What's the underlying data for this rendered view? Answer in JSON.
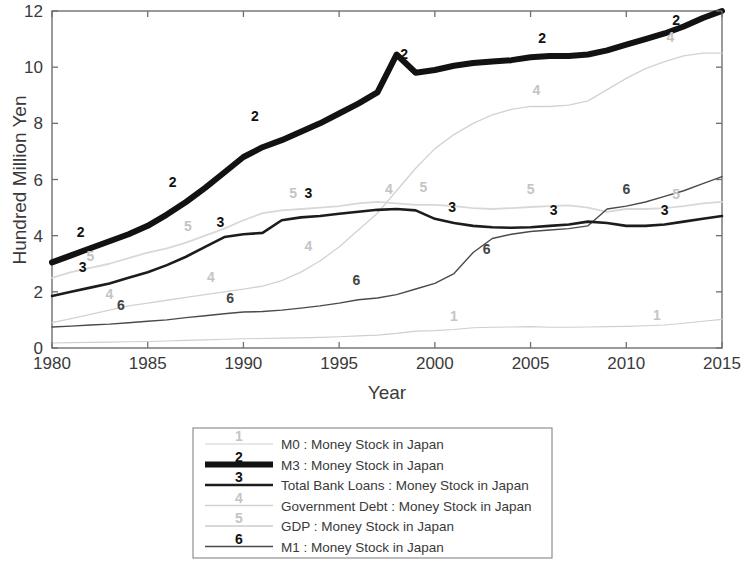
{
  "figure": {
    "background_color": "#ffffff",
    "axis_color": "#6f6f6f"
  },
  "chart_data": {
    "type": "line",
    "title": "",
    "subtitle": "",
    "xlabel": "Year",
    "ylabel": "Hundred Million Yen",
    "xlim": [
      1980,
      2015
    ],
    "ylim": [
      0,
      12
    ],
    "xticks": [
      1980,
      1985,
      1990,
      1995,
      2000,
      2005,
      2010,
      2015
    ],
    "xtick_labels": [
      "1980",
      "1985",
      "1990",
      "1995",
      "2000",
      "2005",
      "2010",
      "2015"
    ],
    "yticks": [
      0,
      2,
      4,
      6,
      8,
      10,
      12
    ],
    "ytick_labels": [
      "0",
      "2",
      "4",
      "6",
      "8",
      "10",
      "12"
    ],
    "grid": false,
    "legend_position": "below-center",
    "x": [
      1980,
      1981,
      1982,
      1983,
      1984,
      1985,
      1986,
      1987,
      1988,
      1989,
      1990,
      1991,
      1992,
      1993,
      1994,
      1995,
      1996,
      1997,
      1998,
      1999,
      2000,
      2001,
      2002,
      2003,
      2004,
      2005,
      2006,
      2007,
      2008,
      2009,
      2010,
      2011,
      2012,
      2013,
      2014,
      2015
    ],
    "series": [
      {
        "id": 1,
        "marker": "1",
        "name": "M0 : Money Stock in Japan",
        "color": "#cfcfcf",
        "width": 1.1,
        "values": [
          0.18,
          0.19,
          0.2,
          0.21,
          0.22,
          0.23,
          0.25,
          0.27,
          0.29,
          0.31,
          0.33,
          0.34,
          0.35,
          0.36,
          0.38,
          0.4,
          0.43,
          0.46,
          0.52,
          0.6,
          0.62,
          0.66,
          0.72,
          0.74,
          0.75,
          0.76,
          0.74,
          0.74,
          0.75,
          0.76,
          0.77,
          0.79,
          0.82,
          0.88,
          0.95,
          1.02
        ]
      },
      {
        "id": 2,
        "marker": "2",
        "name": "M3 : Money Stock in Japan",
        "color": "#121212",
        "width": 6.0,
        "values": [
          3.05,
          3.3,
          3.55,
          3.8,
          4.05,
          4.35,
          4.75,
          5.2,
          5.7,
          6.25,
          6.8,
          7.15,
          7.4,
          7.7,
          8.0,
          8.35,
          8.7,
          9.1,
          10.45,
          9.8,
          9.9,
          10.05,
          10.15,
          10.2,
          10.25,
          10.35,
          10.4,
          10.4,
          10.45,
          10.6,
          10.8,
          11.0,
          11.2,
          11.45,
          11.75,
          12.0
        ]
      },
      {
        "id": 3,
        "marker": "3",
        "name": "Total Bank Loans : Money Stock in Japan",
        "color": "#1c1c1c",
        "width": 2.6,
        "values": [
          1.85,
          2.0,
          2.15,
          2.3,
          2.5,
          2.7,
          2.95,
          3.25,
          3.6,
          3.95,
          4.05,
          4.1,
          4.55,
          4.65,
          4.7,
          4.78,
          4.85,
          4.92,
          4.95,
          4.9,
          4.6,
          4.45,
          4.35,
          4.3,
          4.28,
          4.3,
          4.35,
          4.4,
          4.5,
          4.45,
          4.35,
          4.35,
          4.4,
          4.5,
          4.6,
          4.7
        ]
      },
      {
        "id": 4,
        "marker": "4",
        "name": "Government Debt : Money Stock in Japan",
        "color": "#d2d2d2",
        "width": 1.3,
        "values": [
          0.9,
          1.05,
          1.2,
          1.35,
          1.5,
          1.6,
          1.7,
          1.8,
          1.9,
          2.0,
          2.1,
          2.2,
          2.4,
          2.7,
          3.1,
          3.6,
          4.2,
          4.8,
          5.6,
          6.4,
          7.1,
          7.6,
          8.0,
          8.3,
          8.5,
          8.6,
          8.6,
          8.65,
          8.8,
          9.2,
          9.6,
          9.95,
          10.2,
          10.4,
          10.5,
          10.5
        ]
      },
      {
        "id": 5,
        "marker": "5",
        "name": "GDP : Money Stock in Japan",
        "color": "#d8d8d8",
        "width": 1.8,
        "values": [
          2.5,
          2.7,
          2.85,
          3.0,
          3.2,
          3.4,
          3.55,
          3.75,
          4.0,
          4.25,
          4.55,
          4.8,
          4.9,
          4.95,
          5.0,
          5.05,
          5.15,
          5.2,
          5.15,
          5.1,
          5.1,
          5.05,
          4.98,
          4.95,
          4.98,
          5.02,
          5.05,
          5.08,
          5.0,
          4.85,
          4.95,
          4.95,
          4.98,
          5.05,
          5.15,
          5.2
        ]
      },
      {
        "id": 6,
        "marker": "6",
        "name": "M1 : Money Stock in Japan",
        "color": "#4a4a4a",
        "width": 1.4,
        "values": [
          0.75,
          0.78,
          0.82,
          0.85,
          0.9,
          0.95,
          1.0,
          1.08,
          1.15,
          1.22,
          1.28,
          1.3,
          1.35,
          1.42,
          1.5,
          1.6,
          1.72,
          1.78,
          1.9,
          2.1,
          2.3,
          2.65,
          3.4,
          3.9,
          4.05,
          4.15,
          4.2,
          4.25,
          4.35,
          4.95,
          5.05,
          5.2,
          5.4,
          5.6,
          5.85,
          6.1
        ]
      }
    ],
    "inline_labels": [
      {
        "series": 2,
        "text": "2",
        "x": 1981.5,
        "y": 3.95
      },
      {
        "series": 2,
        "text": "2",
        "x": 1986.3,
        "y": 5.75
      },
      {
        "series": 2,
        "text": "2",
        "x": 1990.6,
        "y": 8.1
      },
      {
        "series": 2,
        "text": "2",
        "x": 1998.4,
        "y": 10.3
      },
      {
        "series": 2,
        "text": "2",
        "x": 2005.6,
        "y": 10.85
      },
      {
        "series": 2,
        "text": "2",
        "x": 2012.6,
        "y": 11.5
      },
      {
        "series": 3,
        "text": "3",
        "x": 1981.6,
        "y": 2.7
      },
      {
        "series": 3,
        "text": "3",
        "x": 1988.8,
        "y": 4.3
      },
      {
        "series": 3,
        "text": "3",
        "x": 1993.4,
        "y": 5.35
      },
      {
        "series": 3,
        "text": "3",
        "x": 2000.9,
        "y": 4.85
      },
      {
        "series": 3,
        "text": "3",
        "x": 2006.2,
        "y": 4.75
      },
      {
        "series": 3,
        "text": "3",
        "x": 2012.0,
        "y": 4.75
      },
      {
        "series": 6,
        "text": "6",
        "x": 1983.6,
        "y": 1.35
      },
      {
        "series": 6,
        "text": "6",
        "x": 1989.3,
        "y": 1.6
      },
      {
        "series": 6,
        "text": "6",
        "x": 1995.9,
        "y": 2.25
      },
      {
        "series": 6,
        "text": "6",
        "x": 2002.7,
        "y": 3.35
      },
      {
        "series": 6,
        "text": "6",
        "x": 2010.0,
        "y": 5.5
      },
      {
        "series": 4,
        "text": "4",
        "x": 1983.0,
        "y": 1.75
      },
      {
        "series": 4,
        "text": "4",
        "x": 1988.3,
        "y": 2.35
      },
      {
        "series": 4,
        "text": "4",
        "x": 1993.4,
        "y": 3.45
      },
      {
        "series": 4,
        "text": "4",
        "x": 1997.6,
        "y": 5.5
      },
      {
        "series": 4,
        "text": "4",
        "x": 2005.3,
        "y": 9.0
      },
      {
        "series": 4,
        "text": "4",
        "x": 2012.3,
        "y": 10.9
      },
      {
        "series": 5,
        "text": "5",
        "x": 1982.0,
        "y": 3.1
      },
      {
        "series": 5,
        "text": "5",
        "x": 1987.1,
        "y": 4.15
      },
      {
        "series": 5,
        "text": "5",
        "x": 1992.6,
        "y": 5.35
      },
      {
        "series": 5,
        "text": "5",
        "x": 1999.4,
        "y": 5.55
      },
      {
        "series": 5,
        "text": "5",
        "x": 2005.0,
        "y": 5.5
      },
      {
        "series": 5,
        "text": "5",
        "x": 2012.6,
        "y": 5.3
      },
      {
        "series": 1,
        "text": "1",
        "x": 2001.0,
        "y": 0.95
      },
      {
        "series": 1,
        "text": "1",
        "x": 2011.6,
        "y": 1.0
      }
    ]
  },
  "legend": {
    "entries": [
      {
        "marker": "1",
        "label": "M0 : Money Stock in Japan"
      },
      {
        "marker": "2",
        "label": "M3 : Money Stock in Japan"
      },
      {
        "marker": "3",
        "label": "Total Bank Loans : Money Stock in Japan"
      },
      {
        "marker": "4",
        "label": "Government Debt : Money Stock in Japan"
      },
      {
        "marker": "5",
        "label": "GDP : Money Stock in Japan"
      },
      {
        "marker": "6",
        "label": "M1 : Money Stock in Japan"
      }
    ]
  }
}
